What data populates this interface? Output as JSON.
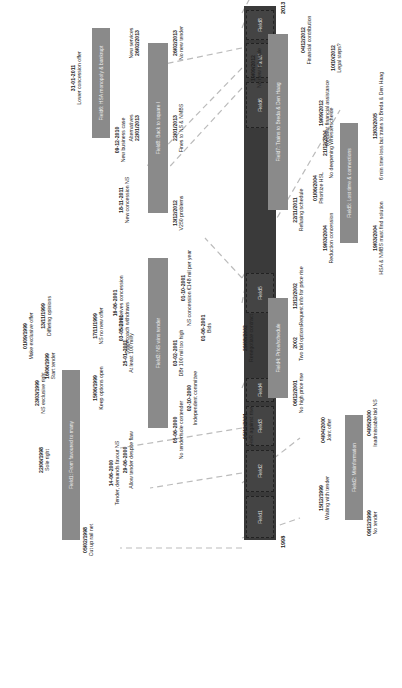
{
  "diagram": {
    "start_year": "1998",
    "end_year": "2013",
    "main_timeline_segments": [
      "Field1",
      "Field2",
      "Field3",
      "Field4",
      "Field5",
      "Field6",
      "Field7",
      "Field8"
    ],
    "fields": [
      {
        "id": "f1",
        "label": "Field1: From favoured to many",
        "events": [
          {
            "date": "05/02/1998",
            "text": "Cut up rail net"
          },
          {
            "date": "22/06/1998",
            "text": "Sole right"
          },
          {
            "date": "23/03/1999",
            "text": "NS exclusive right"
          },
          {
            "date": "16/06/1999",
            "text": "Start tender"
          },
          {
            "date": "01/09/1999",
            "text": "Make exclusive offer"
          },
          {
            "date": "13/11/1999",
            "text": "Differing opinions"
          },
          {
            "date": "15/06/1999",
            "text": "Keep options open"
          },
          {
            "date": "17/11/1999",
            "text": "NS no new offer"
          }
        ]
      },
      {
        "id": "f2",
        "label": "Field2: Misinformation",
        "events": [
          {
            "date": "09/12/1999",
            "text": "No tender"
          },
          {
            "date": "15/12/1999",
            "text": "Waiting with tender"
          },
          {
            "date": "04/04/2000",
            "text": "Joint offer"
          },
          {
            "date": "04/05/2000",
            "text": "Inadmissable bid NS"
          }
        ]
      },
      {
        "id": "f3",
        "label": "Field3: NS wins tender",
        "events": [
          {
            "date": "14-06-2000",
            "text": "Tender, demands favour NS"
          },
          {
            "date": "29-06-2000",
            "text": "Allow tender despite flaw"
          },
          {
            "date": "05-06-2000",
            "text": "No tender/sole contender"
          },
          {
            "date": "02-10-2000",
            "text": "Independent committee"
          },
          {
            "date": "25-01-2001",
            "text": "At least 100 mil/y"
          },
          {
            "date": "03-02-2001",
            "text": "DBr 100 mil too high"
          },
          {
            "date": "03-05-2001",
            "text": "Stagecoach withdraws"
          },
          {
            "date": "16-06-2001",
            "text": "NS receives concession"
          },
          {
            "date": "01-06-2001",
            "text": "Bids"
          },
          {
            "date": "01-10-2001",
            "text": "NS concession €148 mil per year"
          }
        ]
      },
      {
        "id": "f4",
        "label": "Field4: Price/schedule",
        "events": [
          {
            "date": "05/12/2001",
            "text": "HvR against rise"
          },
          {
            "date": "06/12/2001",
            "text": "No high price rise"
          },
          {
            "date": "29/08/2002",
            "text": "Renegotiate contract"
          },
          {
            "date": "2002",
            "text": "Two bid options"
          },
          {
            "date": "12/12/2002",
            "text": "Request info for price rise"
          }
        ]
      },
      {
        "id": "f5",
        "label": "Field5: Lost time & connections",
        "events": [
          {
            "date": "19/03/2004",
            "text": "Reduction concession"
          },
          {
            "date": "19/03/2004",
            "text": "HSA & NMBS must find solution"
          },
          {
            "date": "01/06/2004",
            "text": "Prioritize HSL"
          },
          {
            "date": "21/12/2004",
            "text": "No deepening Whesterschelde"
          },
          {
            "date": "12/03/2005",
            "text": "6 min time loss but trains to Breda & Den Haag"
          }
        ]
      },
      {
        "id": "f6",
        "label": "Field6: HSA monopoly & bankrupt",
        "events": [
          {
            "date": "09-12-2010",
            "text": "New business case"
          },
          {
            "date": "31-01-2011",
            "text": "Lower concession offer"
          },
          {
            "date": "18-11-2011",
            "text": "New concession NS"
          }
        ]
      },
      {
        "id": "f7",
        "label": "Field7: Trains to Breda & Den Haag",
        "events": [
          {
            "date": "22/11/2011",
            "text": "Refusing schedule"
          },
          {
            "date": "19/09/2012",
            "text": "No new schedule"
          },
          {
            "date": "19/09/2012",
            "text": "Request financial assistance"
          },
          {
            "date": "10/10/2012",
            "text": "Legal steps?"
          },
          {
            "date": "04/12/2012",
            "text": "Financial contribution"
          }
        ]
      },
      {
        "id": "f8",
        "label": "Field8: Back to square I",
        "events": [
          {
            "date": "13/12/2012",
            "text": "V250 problems"
          },
          {
            "date": "22/01/2013",
            "text": "Alternatives"
          },
          {
            "date": "22/01/2013",
            "text": "Fines to NS & NMBS"
          },
          {
            "date": "26/02/2013",
            "text": "New services"
          },
          {
            "date": "26/02/2013",
            "text": "No new tender"
          }
        ]
      }
    ]
  }
}
